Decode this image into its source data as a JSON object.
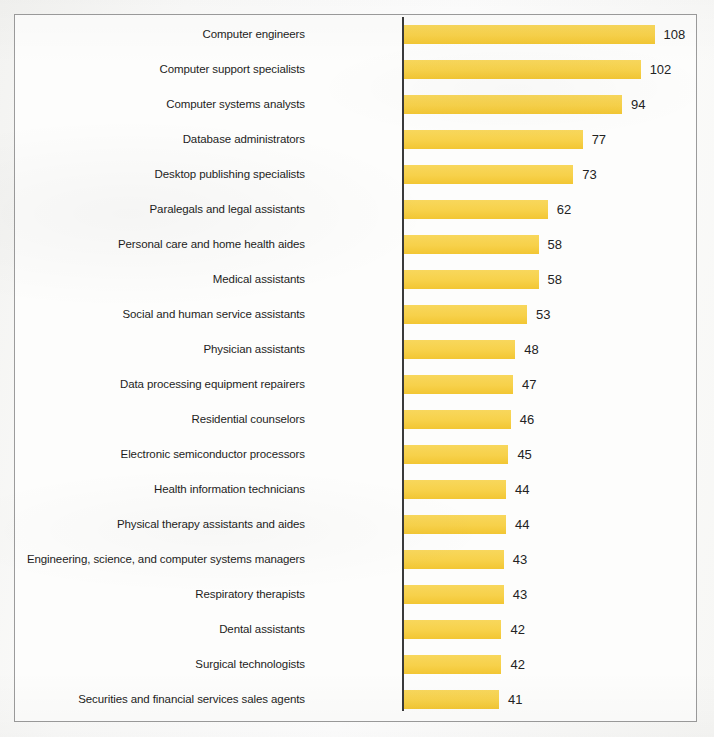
{
  "chart_data": {
    "type": "bar",
    "orientation": "horizontal",
    "title": "",
    "subtitle": "",
    "xlabel": "",
    "ylabel": "",
    "grid": false,
    "legend": null,
    "xlim": [
      0,
      108
    ],
    "categories": [
      "Computer engineers",
      "Computer support specialists",
      "Computer systems analysts",
      "Database administrators",
      "Desktop publishing specialists",
      "Paralegals and legal assistants",
      "Personal care and home health aides",
      "Medical assistants",
      "Social and human service assistants",
      "Physician assistants",
      "Data processing equipment repairers",
      "Residential counselors",
      "Electronic semiconductor processors",
      "Health information technicians",
      "Physical therapy assistants and aides",
      "Engineering, science, and computer systems managers",
      "Respiratory therapists",
      "Dental assistants",
      "Surgical technologists",
      "Securities and financial services sales agents"
    ],
    "values": [
      108,
      102,
      94,
      77,
      73,
      62,
      58,
      58,
      53,
      48,
      47,
      46,
      45,
      44,
      44,
      43,
      43,
      42,
      42,
      41
    ],
    "value_labels": [
      "108",
      "102",
      "94",
      "77",
      "73",
      "62",
      "58",
      "58",
      "53",
      "48",
      "47",
      "46",
      "45",
      "44",
      "44",
      "43",
      "43",
      "42",
      "42",
      "41"
    ]
  },
  "style": {
    "bar_color": "#F7D14A",
    "axis_color": "#3A3A3A",
    "frame_color": "#9B9B9B",
    "label_color": "#1D1D1D",
    "value_color": "#232323",
    "background": "#FDFDFC"
  }
}
